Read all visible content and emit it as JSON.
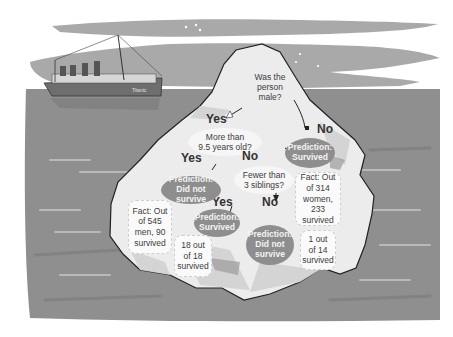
{
  "colors": {
    "sky_band": "#a8a8a8",
    "sea": "#8f8f8f",
    "iceberg": "#ebebeb",
    "prediction_fill": "#8e8e8e",
    "text": "#3c3c3c"
  },
  "ship": {
    "name_label": "Titanic",
    "icon": "ship-icon"
  },
  "tree": {
    "root": {
      "question": "Was the person male?"
    },
    "root_yes": {
      "label": "Yes"
    },
    "root_no": {
      "label": "No"
    },
    "age_node": {
      "question": "More than 9.5 years old?"
    },
    "age_yes": {
      "label": "Yes"
    },
    "age_no": {
      "label": "No"
    },
    "siblings_node": {
      "question": "Fewer than 3 siblings?"
    },
    "siblings_yes": {
      "label": "Yes"
    },
    "siblings_no": {
      "label": "No"
    },
    "leaf_female": {
      "prediction": "Prediction: Survived",
      "fact": "Fact: Out of 314 women, 233 survived"
    },
    "leaf_adult_male": {
      "prediction": "Prediction: Did not survive",
      "fact": "Fact: Out of 545 men, 90 survived"
    },
    "leaf_boy_few_sib": {
      "prediction": "Prediction: Survived",
      "fact": "18 out of 18 survived"
    },
    "leaf_boy_many_sib": {
      "prediction": "Prediction: Did not survive",
      "fact": "1 out of 14 survived"
    }
  },
  "text_lines": {
    "root_q": [
      "Was the",
      "person",
      "male?"
    ],
    "age_q": [
      "More than",
      "9.5 years old?"
    ],
    "sib_q": [
      "Fewer than",
      "3 siblings?"
    ],
    "pred_survived": [
      "Prediction:",
      "Survived"
    ],
    "pred_not_one": [
      "Prediction:",
      "Did not survive"
    ],
    "pred_not_three": [
      "Prediction:",
      "Did not",
      "survive"
    ],
    "fact_women": [
      "Fact: Out",
      "of 314",
      "women, 233",
      "survived"
    ],
    "fact_men": [
      "Fact: Out",
      "of 545",
      "men, 90",
      "survived"
    ],
    "fact_18": [
      "18 out",
      "of 18",
      "survived"
    ],
    "fact_14": [
      "1 out",
      "of 14",
      "survived"
    ]
  }
}
